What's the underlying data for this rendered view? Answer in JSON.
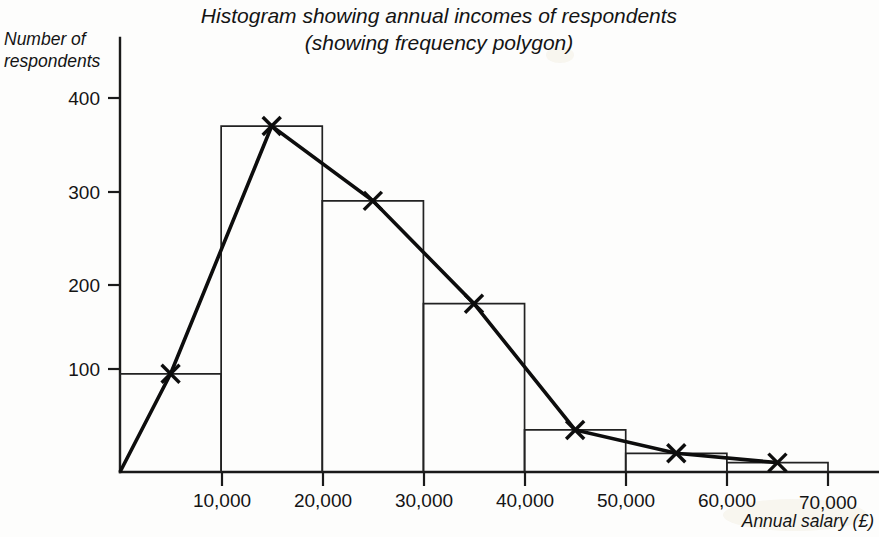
{
  "chart_data": {
    "type": "bar",
    "title": "Histogram showing annual incomes of respondents",
    "subtitle": "(showing frequency polygon)",
    "xlabel": "Annual salary (£)",
    "ylabel_line1": "Number of",
    "ylabel_line2": "respondents",
    "xlim": [
      0,
      72000
    ],
    "ylim": [
      0,
      430
    ],
    "grid": false,
    "legend": "none",
    "x_tick_labels": [
      "10,000",
      "20,000",
      "30,000",
      "40,000",
      "50,000",
      "60,000",
      "70,000"
    ],
    "x_tick_values": [
      10000,
      20000,
      30000,
      40000,
      50000,
      60000,
      70000
    ],
    "y_tick_labels": [
      "100",
      "200",
      "300",
      "400"
    ],
    "y_tick_values": [
      100,
      200,
      300,
      400
    ],
    "bin_edges": [
      0,
      10000,
      20000,
      30000,
      40000,
      50000,
      60000,
      70000
    ],
    "categories": [
      "0-10,000",
      "10,000-20,000",
      "20,000-30,000",
      "30,000-40,000",
      "40,000-50,000",
      "50,000-60,000",
      "60,000-70,000"
    ],
    "values": [
      105,
      370,
      290,
      180,
      45,
      20,
      10
    ],
    "series": [
      {
        "name": "Frequency polygon",
        "x": [
          0,
          5000,
          15000,
          25000,
          35000,
          45000,
          55000,
          65000
        ],
        "values": [
          0,
          105,
          370,
          290,
          180,
          45,
          20,
          10
        ],
        "marker": "x"
      }
    ]
  },
  "figure": {
    "title": "Histogram showing annual incomes of respondents",
    "subtitle": "(showing frequency polygon)",
    "y_axis_label_line1": "Number of",
    "y_axis_label_line2": "respondents",
    "x_axis_label": "Annual salary (£)",
    "y_ticks": [
      {
        "label": "400"
      },
      {
        "label": "300"
      },
      {
        "label": "200"
      },
      {
        "label": "100"
      }
    ],
    "x_ticks": [
      {
        "label": "10,000"
      },
      {
        "label": "20,000"
      },
      {
        "label": "30,000"
      },
      {
        "label": "40,000"
      },
      {
        "label": "50,000"
      },
      {
        "label": "60,000"
      },
      {
        "label": "70,000"
      }
    ]
  },
  "colors": {
    "ink": "#111111",
    "background": "#fdfdfc",
    "bar_stroke": "#222222",
    "polygon_stroke": "#0d0d0d"
  }
}
